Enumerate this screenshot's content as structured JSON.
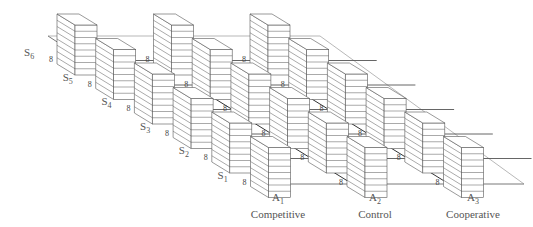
{
  "diagram": {
    "columns": [
      {
        "id": "A",
        "sub": "1",
        "label": "Competitive"
      },
      {
        "id": "A",
        "sub": "2",
        "label": "Control"
      },
      {
        "id": "A",
        "sub": "3",
        "label": "Cooperative"
      }
    ],
    "rows": [
      {
        "id": "S",
        "sub": "6"
      },
      {
        "id": "S",
        "sub": "5"
      },
      {
        "id": "S",
        "sub": "4"
      },
      {
        "id": "S",
        "sub": "3"
      },
      {
        "id": "S",
        "sub": "2"
      },
      {
        "id": "S",
        "sub": "1"
      }
    ],
    "cell_count": "8",
    "layers_per_stack": 8,
    "colors": {
      "line": "#555555",
      "fill": "#ffffff"
    }
  }
}
